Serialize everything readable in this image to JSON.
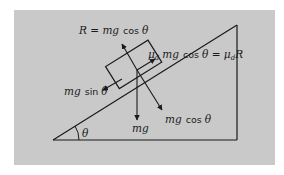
{
  "diagram": {
    "background_color": "#c9c9c9",
    "line_color": "#1a1a1a",
    "labels": {
      "normal_force": {
        "lhs": "R",
        "eq": " = ",
        "mg": "mg",
        "fn": "cos",
        "theta": "θ"
      },
      "friction": {
        "mu": "μ",
        "sub": "d",
        "mg": "mg",
        "fn": "cos",
        "theta": "θ",
        "eq": " = ",
        "rhs_mu": "μ",
        "rhs_sub": "d",
        "rhs_R": "R"
      },
      "parallel_component": {
        "mg": "mg",
        "fn": "sin",
        "theta": "θ"
      },
      "perpendicular_component": {
        "mg": "mg",
        "fn": "cos",
        "theta": "θ"
      },
      "weight": "mg",
      "angle": "θ"
    },
    "geometry": {
      "incline_base_left": [
        53,
        140
      ],
      "incline_right_angle": [
        237,
        140
      ],
      "incline_apex": [
        237,
        25
      ]
    }
  }
}
